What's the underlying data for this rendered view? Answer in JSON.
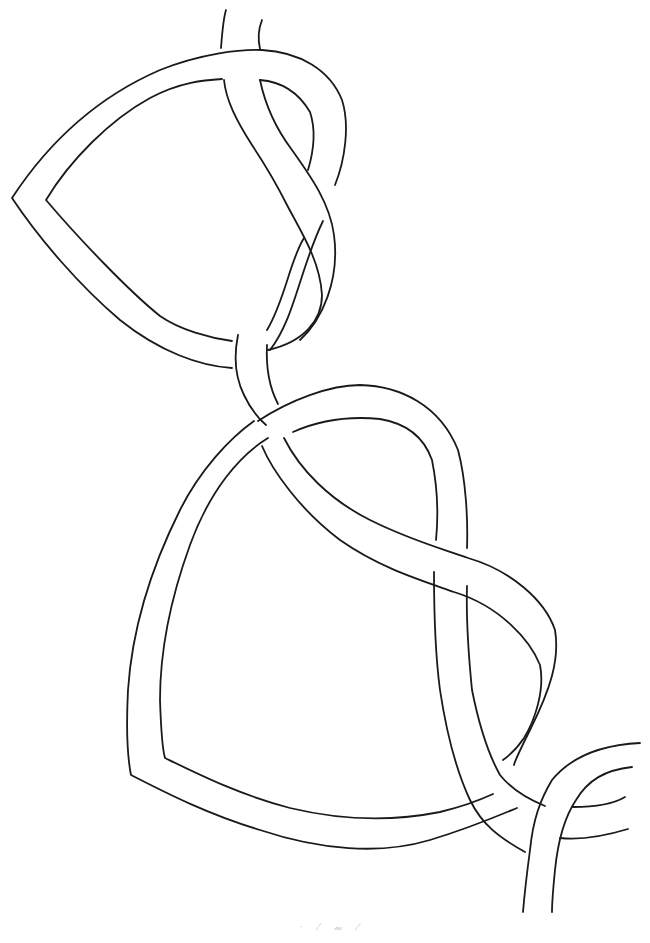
{
  "artwork": {
    "subject": "Celtic knot interlace line drawing",
    "stroke_color": "#1a1a1a",
    "background_color": "#ffffff",
    "elements": [
      {
        "name": "upper-loop",
        "description": "heart-shaped band loop with pointed left tip"
      },
      {
        "name": "central-strand",
        "description": "band entering from top, twisting through both loops"
      },
      {
        "name": "lower-loop",
        "description": "large rounded-triangle band loop"
      },
      {
        "name": "bottom-right-strand",
        "description": "band curving out to bottom and right edges"
      }
    ]
  },
  "signature": {
    "text": "· ⁄ 𝓂 ⁄"
  }
}
